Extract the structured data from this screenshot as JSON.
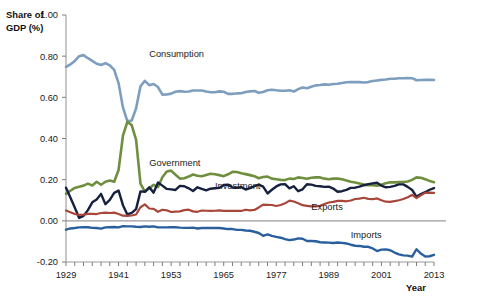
{
  "chart_data": {
    "type": "line",
    "title": "",
    "xlabel": "Year",
    "ylabel": "Share of GDP (%)",
    "ylabel_line1": "Share of",
    "ylabel_line2": "GDP (%)",
    "xlim": [
      1929,
      2013
    ],
    "ylim": [
      -0.2,
      1.0
    ],
    "grid": false,
    "legend_position": "inline-annotations",
    "y_ticks": [
      "1.00",
      "0.80",
      "0.60",
      "0.40",
      "0.20",
      "0.00",
      "-0.20"
    ],
    "y_tick_values": [
      1.0,
      0.8,
      0.6,
      0.4,
      0.2,
      0.0,
      -0.2
    ],
    "x_ticks": [
      "1929",
      "1941",
      "1953",
      "1965",
      "1977",
      "1989",
      "2001",
      "2013"
    ],
    "x_tick_values": [
      1929,
      1941,
      1953,
      1965,
      1977,
      1989,
      2001,
      2013
    ],
    "x_minor_tick_step": 2,
    "zero_reference_line": 0.0,
    "colors": {
      "consumption": "#7d9ebf",
      "government": "#6f8f3f",
      "investment": "#16213f",
      "exports": "#a8463a",
      "imports": "#2a5f9e",
      "axis": "#9a9a9a",
      "text": "#1b1b1b"
    },
    "x": [
      1929,
      1930,
      1931,
      1932,
      1933,
      1934,
      1935,
      1936,
      1937,
      1938,
      1939,
      1940,
      1941,
      1942,
      1943,
      1944,
      1945,
      1946,
      1947,
      1948,
      1949,
      1950,
      1951,
      1952,
      1953,
      1954,
      1955,
      1956,
      1957,
      1958,
      1959,
      1960,
      1961,
      1962,
      1963,
      1964,
      1965,
      1966,
      1967,
      1968,
      1969,
      1970,
      1971,
      1972,
      1973,
      1974,
      1975,
      1976,
      1977,
      1978,
      1979,
      1980,
      1981,
      1982,
      1983,
      1984,
      1985,
      1986,
      1987,
      1988,
      1989,
      1990,
      1991,
      1992,
      1993,
      1994,
      1995,
      1996,
      1997,
      1998,
      1999,
      2000,
      2001,
      2002,
      2003,
      2004,
      2005,
      2006,
      2007,
      2008,
      2009,
      2010,
      2011,
      2012,
      2013
    ],
    "series": [
      {
        "name": "Consumption",
        "color": "#7d9ebf",
        "label_x": 1948,
        "label_y": 0.795,
        "values": [
          0.748,
          0.76,
          0.777,
          0.8,
          0.805,
          0.79,
          0.777,
          0.763,
          0.757,
          0.766,
          0.755,
          0.733,
          0.669,
          0.551,
          0.484,
          0.487,
          0.547,
          0.654,
          0.68,
          0.659,
          0.665,
          0.65,
          0.613,
          0.614,
          0.618,
          0.627,
          0.63,
          0.627,
          0.628,
          0.633,
          0.633,
          0.633,
          0.628,
          0.625,
          0.625,
          0.629,
          0.627,
          0.617,
          0.617,
          0.619,
          0.62,
          0.626,
          0.629,
          0.631,
          0.622,
          0.626,
          0.634,
          0.637,
          0.634,
          0.632,
          0.632,
          0.634,
          0.628,
          0.64,
          0.648,
          0.644,
          0.651,
          0.658,
          0.66,
          0.663,
          0.661,
          0.665,
          0.666,
          0.67,
          0.673,
          0.674,
          0.674,
          0.674,
          0.672,
          0.674,
          0.679,
          0.682,
          0.685,
          0.687,
          0.69,
          0.69,
          0.693,
          0.693,
          0.694,
          0.693,
          0.683,
          0.684,
          0.685,
          0.685,
          0.684
        ]
      },
      {
        "name": "Government",
        "color": "#6f8f3f",
        "label_x": 1948,
        "label_y": 0.265,
        "values": [
          0.131,
          0.146,
          0.16,
          0.166,
          0.171,
          0.181,
          0.172,
          0.19,
          0.175,
          0.19,
          0.196,
          0.19,
          0.247,
          0.414,
          0.481,
          0.465,
          0.393,
          0.181,
          0.142,
          0.157,
          0.175,
          0.164,
          0.212,
          0.24,
          0.244,
          0.224,
          0.205,
          0.207,
          0.215,
          0.225,
          0.219,
          0.217,
          0.223,
          0.229,
          0.226,
          0.222,
          0.217,
          0.226,
          0.238,
          0.237,
          0.231,
          0.227,
          0.222,
          0.217,
          0.207,
          0.213,
          0.215,
          0.205,
          0.202,
          0.199,
          0.198,
          0.205,
          0.203,
          0.211,
          0.208,
          0.204,
          0.209,
          0.211,
          0.211,
          0.205,
          0.202,
          0.205,
          0.206,
          0.202,
          0.196,
          0.19,
          0.186,
          0.181,
          0.176,
          0.173,
          0.173,
          0.171,
          0.176,
          0.183,
          0.187,
          0.187,
          0.188,
          0.189,
          0.191,
          0.199,
          0.211,
          0.209,
          0.202,
          0.194,
          0.188
        ]
      },
      {
        "name": "Investment",
        "color": "#16213f",
        "label_x": 1963,
        "label_y": 0.153,
        "values": [
          0.161,
          0.113,
          0.065,
          0.014,
          0.024,
          0.052,
          0.09,
          0.104,
          0.131,
          0.081,
          0.102,
          0.136,
          0.147,
          0.076,
          0.031,
          0.039,
          0.057,
          0.143,
          0.141,
          0.163,
          0.137,
          0.186,
          0.171,
          0.155,
          0.153,
          0.15,
          0.17,
          0.168,
          0.158,
          0.145,
          0.163,
          0.155,
          0.148,
          0.156,
          0.158,
          0.16,
          0.174,
          0.176,
          0.162,
          0.161,
          0.164,
          0.152,
          0.159,
          0.168,
          0.176,
          0.166,
          0.133,
          0.151,
          0.167,
          0.177,
          0.178,
          0.158,
          0.168,
          0.144,
          0.153,
          0.178,
          0.176,
          0.17,
          0.168,
          0.165,
          0.166,
          0.157,
          0.141,
          0.144,
          0.15,
          0.16,
          0.161,
          0.166,
          0.173,
          0.178,
          0.182,
          0.185,
          0.171,
          0.163,
          0.165,
          0.17,
          0.177,
          0.177,
          0.165,
          0.15,
          0.117,
          0.13,
          0.139,
          0.151,
          0.159
        ]
      },
      {
        "name": "Exports",
        "color": "#a8463a",
        "label_x": 1985,
        "label_y": 0.052,
        "values": [
          0.05,
          0.042,
          0.033,
          0.029,
          0.03,
          0.034,
          0.034,
          0.033,
          0.038,
          0.04,
          0.038,
          0.04,
          0.033,
          0.025,
          0.024,
          0.026,
          0.031,
          0.066,
          0.08,
          0.06,
          0.058,
          0.044,
          0.054,
          0.051,
          0.043,
          0.045,
          0.046,
          0.052,
          0.054,
          0.046,
          0.044,
          0.05,
          0.049,
          0.048,
          0.049,
          0.051,
          0.048,
          0.048,
          0.048,
          0.048,
          0.048,
          0.054,
          0.051,
          0.053,
          0.065,
          0.079,
          0.078,
          0.077,
          0.072,
          0.077,
          0.085,
          0.098,
          0.094,
          0.085,
          0.076,
          0.073,
          0.07,
          0.07,
          0.073,
          0.082,
          0.089,
          0.092,
          0.097,
          0.097,
          0.095,
          0.099,
          0.106,
          0.108,
          0.112,
          0.107,
          0.105,
          0.109,
          0.1,
          0.093,
          0.092,
          0.096,
          0.1,
          0.106,
          0.115,
          0.126,
          0.11,
          0.124,
          0.136,
          0.137,
          0.136
        ]
      },
      {
        "name": "Imports",
        "color": "#2a5f9e",
        "label_x": 1994,
        "label_y": -0.083,
        "values": [
          -0.043,
          -0.037,
          -0.035,
          -0.032,
          -0.031,
          -0.031,
          -0.034,
          -0.035,
          -0.038,
          -0.032,
          -0.031,
          -0.03,
          -0.032,
          -0.026,
          -0.027,
          -0.027,
          -0.029,
          -0.03,
          -0.027,
          -0.029,
          -0.027,
          -0.032,
          -0.032,
          -0.032,
          -0.031,
          -0.031,
          -0.033,
          -0.034,
          -0.034,
          -0.033,
          -0.037,
          -0.035,
          -0.034,
          -0.035,
          -0.035,
          -0.035,
          -0.037,
          -0.04,
          -0.04,
          -0.044,
          -0.044,
          -0.047,
          -0.048,
          -0.053,
          -0.059,
          -0.073,
          -0.066,
          -0.073,
          -0.078,
          -0.082,
          -0.089,
          -0.094,
          -0.091,
          -0.085,
          -0.087,
          -0.098,
          -0.098,
          -0.099,
          -0.104,
          -0.105,
          -0.106,
          -0.108,
          -0.105,
          -0.107,
          -0.11,
          -0.116,
          -0.121,
          -0.122,
          -0.126,
          -0.126,
          -0.134,
          -0.147,
          -0.14,
          -0.139,
          -0.143,
          -0.154,
          -0.163,
          -0.168,
          -0.169,
          -0.174,
          -0.138,
          -0.159,
          -0.173,
          -0.172,
          -0.165
        ]
      }
    ]
  }
}
